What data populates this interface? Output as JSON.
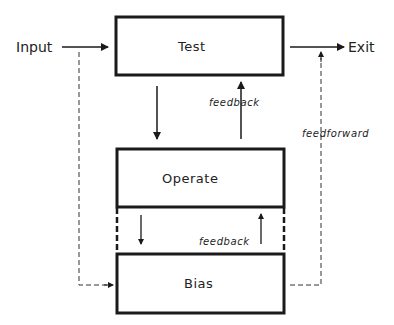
{
  "diagram": {
    "nodes": [
      {
        "id": "test",
        "label": "Test"
      },
      {
        "id": "operate",
        "label": "Operate"
      },
      {
        "id": "bias",
        "label": "Bias"
      }
    ],
    "terminals": {
      "input": "Input",
      "exit": "Exit"
    },
    "edge_labels": {
      "feedback_operate_test": "feedback",
      "feedback_bias_operate": "feedback",
      "feedforward_bias_exit": "feedforward"
    },
    "edges": [
      {
        "from": "input",
        "to": "test",
        "style": "solid"
      },
      {
        "from": "test",
        "to": "exit",
        "style": "solid"
      },
      {
        "from": "test",
        "to": "operate",
        "style": "solid"
      },
      {
        "from": "operate",
        "to": "test",
        "style": "solid",
        "label": "feedback"
      },
      {
        "from": "operate",
        "to": "bias",
        "style": "solid"
      },
      {
        "from": "bias",
        "to": "operate",
        "style": "solid",
        "label": "feedback"
      },
      {
        "from": "input",
        "to": "bias",
        "style": "dashed"
      },
      {
        "from": "bias",
        "to": "exit",
        "style": "dashed",
        "label": "feedforward"
      }
    ],
    "colors": {
      "stroke": "#1a1a1a",
      "background": "#ffffff"
    }
  }
}
